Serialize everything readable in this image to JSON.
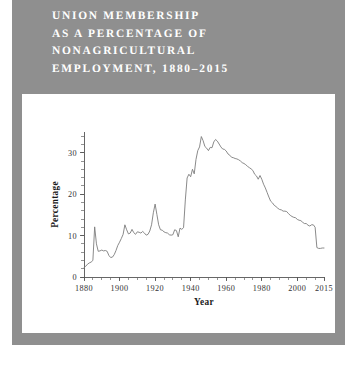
{
  "figure": {
    "title": "UNION MEMBERSHIP\nAS A PERCENTAGE OF\nNONAGRICULTURAL\nEMPLOYMENT, 1880–2015",
    "title_lines": [
      "UNION MEMBERSHIP",
      "AS A PERCENTAGE OF",
      "NONAGRICULTURAL",
      "EMPLOYMENT, 1880–2015"
    ],
    "background_color": "#8f8f8f",
    "panel_color": "#ffffff",
    "title_color": "#ffffff",
    "line_color": "#7d7d7d",
    "axis_color": "#555555"
  },
  "chart_data": {
    "type": "line",
    "title": "UNION MEMBERSHIP AS A PERCENTAGE OF NONAGRICULTURAL EMPLOYMENT, 1880–2015",
    "xlabel": "Year",
    "ylabel": "Percentage",
    "xlim": [
      1880,
      2015
    ],
    "ylim": [
      0,
      35
    ],
    "grid": false,
    "legend": "none",
    "x_ticks": [
      1880,
      1900,
      1920,
      1940,
      1960,
      1980,
      2000,
      2015
    ],
    "x_tick_labels": [
      "1880",
      "1900",
      "1920",
      "1940",
      "1960",
      "1980",
      "2000",
      "2015"
    ],
    "x_minor_tick_step": 5,
    "y_ticks": [
      0,
      10,
      20,
      30
    ],
    "y_tick_labels": [
      "0",
      "10",
      "20",
      "30"
    ],
    "y_minor_tick_step": 2,
    "series": [
      {
        "name": "Union membership (% of nonagricultural employment)",
        "x": [
          1880,
          1881,
          1882,
          1883,
          1884,
          1885,
          1886,
          1887,
          1888,
          1889,
          1890,
          1891,
          1892,
          1893,
          1894,
          1895,
          1896,
          1897,
          1898,
          1899,
          1900,
          1901,
          1902,
          1903,
          1904,
          1905,
          1906,
          1907,
          1908,
          1909,
          1910,
          1911,
          1912,
          1913,
          1914,
          1915,
          1916,
          1917,
          1918,
          1919,
          1920,
          1921,
          1922,
          1923,
          1924,
          1925,
          1926,
          1927,
          1928,
          1929,
          1930,
          1931,
          1932,
          1933,
          1934,
          1935,
          1936,
          1937,
          1938,
          1939,
          1940,
          1941,
          1942,
          1943,
          1944,
          1945,
          1946,
          1947,
          1948,
          1949,
          1950,
          1951,
          1952,
          1953,
          1954,
          1955,
          1956,
          1957,
          1958,
          1959,
          1960,
          1961,
          1962,
          1963,
          1964,
          1965,
          1966,
          1967,
          1968,
          1969,
          1970,
          1971,
          1972,
          1973,
          1974,
          1975,
          1976,
          1977,
          1978,
          1979,
          1980,
          1981,
          1982,
          1983,
          1984,
          1985,
          1986,
          1987,
          1988,
          1989,
          1990,
          1991,
          1992,
          1993,
          1994,
          1995,
          1996,
          1997,
          1998,
          1999,
          2000,
          2001,
          2002,
          2003,
          2004,
          2005,
          2006,
          2007,
          2008,
          2009,
          2010,
          2011,
          2012,
          2013,
          2014,
          2015
        ],
        "values": [
          2.3,
          2.6,
          3.1,
          3.4,
          3.6,
          4.0,
          12.1,
          8.0,
          6.2,
          6.3,
          6.5,
          6.3,
          6.4,
          6.2,
          5.2,
          4.7,
          4.8,
          5.4,
          6.4,
          7.6,
          8.4,
          9.3,
          10.3,
          12.6,
          11.4,
          10.4,
          10.6,
          11.5,
          10.7,
          10.3,
          10.9,
          10.8,
          10.6,
          11.0,
          10.6,
          10.1,
          10.3,
          11.1,
          12.6,
          15.5,
          17.6,
          15.1,
          12.6,
          11.4,
          11.3,
          10.9,
          10.7,
          10.6,
          10.2,
          10.1,
          10.2,
          11.4,
          11.2,
          9.7,
          11.8,
          11.5,
          11.9,
          18.6,
          23.9,
          24.8,
          24.2,
          26.0,
          24.9,
          28.4,
          30.5,
          31.4,
          33.9,
          32.9,
          31.5,
          31.1,
          30.5,
          31.3,
          31.2,
          32.6,
          33.2,
          32.8,
          32.1,
          31.4,
          30.9,
          30.8,
          30.4,
          29.7,
          29.4,
          28.9,
          28.8,
          28.6,
          28.5,
          28.3,
          28.0,
          27.6,
          27.4,
          27.1,
          26.7,
          26.4,
          26.1,
          25.7,
          24.8,
          24.4,
          23.6,
          24.5,
          23.6,
          22.4,
          21.5,
          20.4,
          19.3,
          18.3,
          17.9,
          17.3,
          17.0,
          16.6,
          16.3,
          16.2,
          15.9,
          15.9,
          15.8,
          15.3,
          14.9,
          14.6,
          14.4,
          14.3,
          13.9,
          13.7,
          13.6,
          13.2,
          12.9,
          12.9,
          12.5,
          12.3,
          12.6,
          12.6,
          12.0,
          7.1,
          6.9,
          6.9,
          7.0,
          7.0
        ]
      }
    ],
    "notable_points": [
      {
        "year": 1886,
        "value": 12.1,
        "note": "early spike"
      },
      {
        "year": 1920,
        "value": 17.6,
        "note": "post-WWI peak"
      },
      {
        "year": 1933,
        "value": 9.7,
        "note": "Depression trough"
      },
      {
        "year": 1946,
        "value": 33.9,
        "note": "peak"
      },
      {
        "year": 1954,
        "value": 33.2,
        "note": "second peak"
      },
      {
        "year": 2015,
        "value": 7.0,
        "note": "end of series"
      }
    ]
  }
}
